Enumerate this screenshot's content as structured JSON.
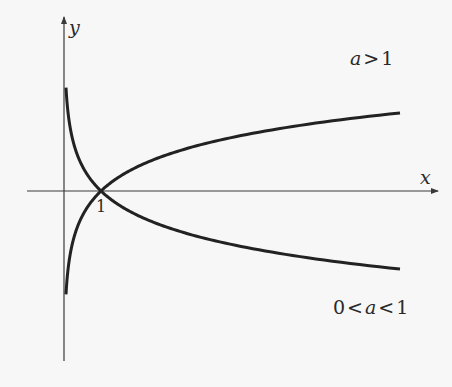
{
  "chart_data": {
    "type": "line",
    "title": "",
    "xlabel": "x",
    "ylabel": "y",
    "x_ticks": [
      {
        "value": 1,
        "label": "1"
      }
    ],
    "grid": false,
    "legend": null,
    "annotations": [
      {
        "text_var": "a",
        "text": "a>1",
        "position": "upper right"
      },
      {
        "text": "0<a<1",
        "position": "lower right"
      }
    ],
    "x": [
      0.05,
      0.1,
      0.25,
      0.5,
      1,
      2,
      3,
      4,
      5,
      6,
      7,
      8,
      9.1
    ],
    "series": [
      {
        "name": "a>1",
        "function": "y = log_a(x)",
        "values": [
          -2.95,
          -2.27,
          -1.37,
          -0.68,
          0,
          0.68,
          1.08,
          1.37,
          1.59,
          1.77,
          1.92,
          2.05,
          2.2
        ]
      },
      {
        "name": "0<a<1",
        "function": "y = log_a(x)",
        "values": [
          2.95,
          2.27,
          1.37,
          0.68,
          0,
          -0.68,
          -1.08,
          -1.37,
          -1.59,
          -1.77,
          -1.92,
          -2.05,
          -2.2
        ]
      }
    ],
    "intersection": {
      "x": 1,
      "y": 0
    },
    "colors": {
      "curves": "#222222",
      "axes": "#3a3a3a",
      "background": "#f7f7f7"
    }
  },
  "labels": {
    "y_axis": "y",
    "x_axis": "x",
    "tick_one": "1",
    "annotation_a_gt_1": "a > 1",
    "annotation_a_between": "0 < a < 1"
  },
  "geometry": {
    "origin_px": [
      64,
      191
    ],
    "unit_x_px": 37,
    "unit_ln_px": 35.4
  }
}
